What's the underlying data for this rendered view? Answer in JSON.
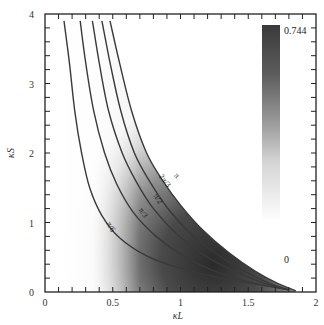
{
  "chart_data": {
    "type": "heatmap",
    "title": "",
    "xlabel": "κL",
    "ylabel": "κS",
    "xlim": [
      0,
      2
    ],
    "ylim": [
      0,
      4
    ],
    "x_ticks": [
      0,
      0.5,
      1,
      1.5,
      2
    ],
    "x_tick_labels": [
      "0",
      "0.5",
      "1",
      "1.5",
      "2"
    ],
    "y_ticks": [
      0,
      1,
      2,
      3,
      4
    ],
    "y_tick_labels": [
      "0",
      "1",
      "2",
      "3",
      "4"
    ],
    "x_minor_step": 0.1,
    "y_minor_step": 0.2,
    "grid": false,
    "colorbar": {
      "min": 0,
      "max": 0.744,
      "min_label": "0",
      "max_label": "0.744",
      "colormap": "white-to-dark-gray"
    },
    "contours": [
      {
        "label": "π/6",
        "points": [
          [
            0.14,
            3.9
          ],
          [
            0.18,
            3.3
          ],
          [
            0.22,
            2.6
          ],
          [
            0.27,
            2.0
          ],
          [
            0.33,
            1.5
          ],
          [
            0.42,
            1.1
          ],
          [
            0.55,
            0.78
          ],
          [
            0.75,
            0.52
          ],
          [
            1.0,
            0.34
          ],
          [
            1.3,
            0.2
          ],
          [
            1.6,
            0.1
          ],
          [
            1.8,
            0.03
          ]
        ]
      },
      {
        "label": "π/3",
        "points": [
          [
            0.26,
            3.9
          ],
          [
            0.3,
            3.3
          ],
          [
            0.36,
            2.6
          ],
          [
            0.44,
            2.0
          ],
          [
            0.53,
            1.55
          ],
          [
            0.65,
            1.15
          ],
          [
            0.82,
            0.8
          ],
          [
            1.02,
            0.52
          ],
          [
            1.25,
            0.3
          ],
          [
            1.5,
            0.15
          ],
          [
            1.8,
            0.03
          ]
        ]
      },
      {
        "label": "π/2",
        "points": [
          [
            0.35,
            3.9
          ],
          [
            0.4,
            3.3
          ],
          [
            0.47,
            2.6
          ],
          [
            0.57,
            2.0
          ],
          [
            0.67,
            1.6
          ],
          [
            0.8,
            1.2
          ],
          [
            0.98,
            0.82
          ],
          [
            1.18,
            0.52
          ],
          [
            1.4,
            0.3
          ],
          [
            1.6,
            0.14
          ],
          [
            1.8,
            0.03
          ]
        ]
      },
      {
        "label": "2π/3",
        "points": [
          [
            0.42,
            3.9
          ],
          [
            0.48,
            3.3
          ],
          [
            0.56,
            2.6
          ],
          [
            0.66,
            2.0
          ],
          [
            0.77,
            1.6
          ],
          [
            0.9,
            1.22
          ],
          [
            1.07,
            0.85
          ],
          [
            1.27,
            0.54
          ],
          [
            1.47,
            0.3
          ],
          [
            1.65,
            0.13
          ],
          [
            1.8,
            0.03
          ]
        ]
      },
      {
        "label": "π",
        "points": [
          [
            0.48,
            3.9
          ],
          [
            0.55,
            3.3
          ],
          [
            0.64,
            2.6
          ],
          [
            0.75,
            2.0
          ],
          [
            0.87,
            1.6
          ],
          [
            1.0,
            1.25
          ],
          [
            1.17,
            0.88
          ],
          [
            1.36,
            0.56
          ],
          [
            1.55,
            0.3
          ],
          [
            1.72,
            0.12
          ],
          [
            1.85,
            0.02
          ]
        ]
      }
    ],
    "contour_label_positions": [
      {
        "label": "π/6",
        "x": 0.47,
        "y": 0.92,
        "angle": 60
      },
      {
        "label": "π/3",
        "x": 0.71,
        "y": 1.12,
        "angle": 58
      },
      {
        "label": "π/2",
        "x": 0.82,
        "y": 1.32,
        "angle": 56
      },
      {
        "label": "2π/3",
        "x": 0.87,
        "y": 1.58,
        "angle": 52
      },
      {
        "label": "π",
        "x": 0.96,
        "y": 1.65,
        "angle": 48
      }
    ],
    "shading_description": "Intensity is highest (~0.744, dark) in region kL 0.5-1.6, kS 0-1; fades to 0 (white) at small kL and beyond the π contour"
  }
}
